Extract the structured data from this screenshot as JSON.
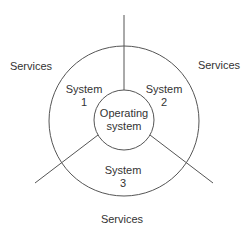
{
  "diagram": {
    "type": "concentric-circles-with-sector-dividers",
    "center_label": {
      "line1": "Operating",
      "line2": "system"
    },
    "systems": [
      {
        "line1": "System",
        "line2": "1"
      },
      {
        "line1": "System",
        "line2": "2"
      },
      {
        "line1": "System",
        "line2": "3"
      }
    ],
    "services": [
      {
        "label": "Services"
      },
      {
        "label": "Services"
      },
      {
        "label": "Services"
      }
    ],
    "colors": {
      "stroke": "#555555",
      "text": "#333333",
      "background": "#ffffff"
    }
  }
}
